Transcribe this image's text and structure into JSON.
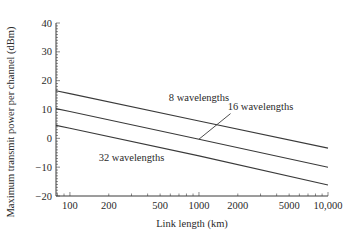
{
  "chart_data": {
    "type": "line",
    "title": "",
    "xlabel": "Link length (km)",
    "ylabel": "Maximum transmit power per channel (dBm)",
    "xscale": "log",
    "xlim": [
      78,
      10000
    ],
    "ylim": [
      -20,
      40
    ],
    "x_ticks": [
      100,
      200,
      500,
      1000,
      2000,
      5000,
      10000
    ],
    "x_tick_labels": [
      "100",
      "200",
      "500",
      "1000",
      "2000",
      "5000",
      "10,000"
    ],
    "y_ticks": [
      -20,
      -10,
      0,
      10,
      20,
      30,
      40
    ],
    "y_tick_labels": [
      "−20",
      "−10",
      "0",
      "10",
      "20",
      "30",
      "40"
    ],
    "grid": false,
    "legend": "inline labels",
    "series": [
      {
        "name": "8 wavelengths",
        "x": [
          78,
          100,
          1000,
          10000
        ],
        "values": [
          16.5,
          15.5,
          6.0,
          -3.4
        ]
      },
      {
        "name": "16 wavelengths",
        "x": [
          78,
          100,
          1000,
          10000
        ],
        "values": [
          10.3,
          9.3,
          -0.3,
          -10.0
        ]
      },
      {
        "name": "32 wavelengths",
        "x": [
          78,
          100,
          1000,
          10000
        ],
        "values": [
          4.5,
          3.5,
          -6.1,
          -16.2
        ]
      }
    ],
    "annotations": [
      {
        "text": "8 wavelengths",
        "x": 1000,
        "y": 14
      },
      {
        "text": "16 wavelengths",
        "x": 3000,
        "y": 11,
        "leader_to": {
          "x": 1000,
          "y": -0.3
        }
      },
      {
        "text": "32 wavelengths",
        "x": 300,
        "y": -6.5
      }
    ]
  }
}
